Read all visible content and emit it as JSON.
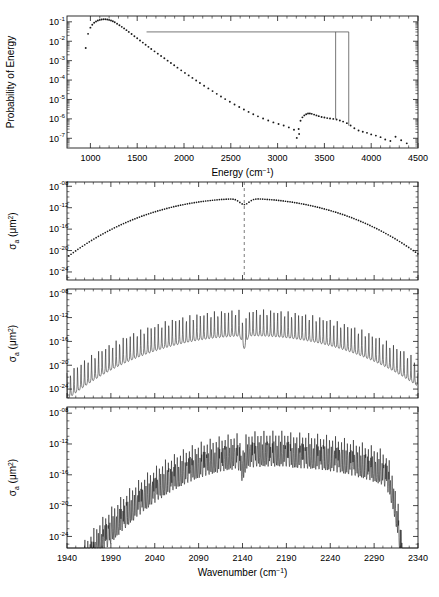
{
  "figure": {
    "background_color": "#ffffff",
    "ink_color": "#1a1a1a",
    "overlay_color": "#555555"
  },
  "chart_data": [
    {
      "id": "panel-1",
      "type": "scatter",
      "title": "",
      "xlabel": "Energy (cm⁻¹)",
      "ylabel": "Probability of Energy",
      "xlim": [
        750,
        4500
      ],
      "ylim_exp": [
        -7.5,
        -0.7
      ],
      "yscale": "log",
      "xticks": [
        1000,
        1500,
        2000,
        2500,
        3000,
        3500,
        4000,
        4500
      ],
      "xtick_labels": [
        "1000",
        "1500",
        "2000",
        "2500",
        "3000",
        "3500",
        "4000",
        "4500"
      ],
      "ytick_exponents": [
        -1,
        -2,
        -3,
        -4,
        -5,
        -6,
        -7
      ],
      "ytick_labels": [
        "10⁻¹",
        "10⁻²",
        "10⁻³",
        "10⁻⁴",
        "10⁻⁵",
        "10⁻⁶",
        "10⁻⁷"
      ],
      "grid": false,
      "legend": "none",
      "marker": "dot",
      "series": [
        {
          "name": "probability-of-energy",
          "x": [
            950,
            975,
            1000,
            1020,
            1040,
            1060,
            1080,
            1100,
            1120,
            1140,
            1160,
            1180,
            1200,
            1220,
            1240,
            1260,
            1285,
            1310,
            1335,
            1360,
            1385,
            1410,
            1440,
            1470,
            1500,
            1530,
            1560,
            1590,
            1620,
            1650,
            1685,
            1720,
            1755,
            1790,
            1825,
            1860,
            1895,
            1930,
            1970,
            2010,
            2050,
            2090,
            2130,
            2170,
            2215,
            2260,
            2305,
            2350,
            2395,
            2440,
            2490,
            2540,
            2590,
            2640,
            2690,
            2740,
            2790,
            2845,
            2900,
            2955,
            3010,
            3065,
            3120,
            3175,
            3230
          ],
          "y_exp": [
            -2.35,
            -1.62,
            -1.3,
            -1.15,
            -1.05,
            -0.98,
            -0.93,
            -0.9,
            -0.88,
            -0.87,
            -0.87,
            -0.88,
            -0.9,
            -0.93,
            -0.97,
            -1.02,
            -1.1,
            -1.18,
            -1.26,
            -1.34,
            -1.43,
            -1.52,
            -1.63,
            -1.74,
            -1.85,
            -1.96,
            -2.07,
            -2.18,
            -2.29,
            -2.4,
            -2.52,
            -2.64,
            -2.76,
            -2.88,
            -3.0,
            -3.12,
            -3.24,
            -3.36,
            -3.5,
            -3.63,
            -3.76,
            -3.89,
            -4.02,
            -4.15,
            -4.29,
            -4.43,
            -4.57,
            -4.71,
            -4.85,
            -4.98,
            -5.12,
            -5.26,
            -5.39,
            -5.52,
            -5.64,
            -5.76,
            -5.87,
            -5.98,
            -6.08,
            -6.18,
            -6.26,
            -6.34,
            -6.44,
            -6.56,
            -6.78
          ]
        },
        {
          "name": "secondary-band",
          "x": [
            3205,
            3225,
            3245,
            3265,
            3285,
            3305,
            3325,
            3345,
            3365,
            3390,
            3415,
            3440,
            3470,
            3500,
            3530,
            3560,
            3595,
            3630,
            3665,
            3700,
            3740,
            3780,
            3820,
            3865,
            3910,
            3955,
            4000,
            4050,
            4100,
            4150,
            4205,
            4260,
            4320,
            4380
          ],
          "y_exp": [
            -6.98,
            -6.52,
            -6.1,
            -5.92,
            -5.82,
            -5.76,
            -5.72,
            -5.72,
            -5.74,
            -5.78,
            -5.82,
            -5.86,
            -5.9,
            -5.93,
            -5.96,
            -5.98,
            -6.0,
            -6.03,
            -6.08,
            -6.14,
            -6.22,
            -6.34,
            -6.48,
            -6.6,
            -6.66,
            -6.72,
            -6.8,
            -6.86,
            -6.94,
            -7.06,
            -7.14,
            -6.92,
            -7.1,
            -7.26
          ]
        }
      ],
      "annotations": [
        {
          "name": "band-selection-overlay",
          "type": "bracket",
          "x_start": 1600,
          "x_end": 3760,
          "y_exp": -1.52,
          "drop_x": [
            3620,
            3760
          ],
          "drop_y_exp": [
            -6.0,
            -6.35
          ]
        }
      ]
    },
    {
      "id": "panel-2",
      "type": "scatter",
      "title": "",
      "xlabel": "",
      "ylabel": "σa (μm²)",
      "ylabel_parts": {
        "sigma": "σ",
        "sub": "a",
        "units": "(μm²)"
      },
      "xlim": [
        1940,
        2340
      ],
      "ylim_exp": [
        -25.5,
        -7.2
      ],
      "yscale": "log",
      "xticks": [
        1940,
        1990,
        2040,
        2090,
        2140,
        2190,
        2240,
        2290,
        2340
      ],
      "ytick_exponents": [
        -8,
        -12,
        -16,
        -20,
        -24
      ],
      "ytick_labels": [
        "10⁻⁰⁸",
        "10⁻¹²",
        "10⁻¹⁶",
        "10⁻²⁰",
        "10⁻²⁴"
      ],
      "grid": false,
      "legend": "none",
      "marker": "dot",
      "description": "Smoothed band absorption cross-section, dotted envelope",
      "series": [
        {
          "name": "sigma-a-smoothed",
          "envelope_peak_exp": -10.3,
          "left_edge_exp": -19.8,
          "right_edge_exp": -19.4,
          "peak_left_x": 2105,
          "peak_right_x": 2180,
          "dip_x": 2142,
          "dip_depth_exp": -11.2
        }
      ],
      "annotations": [
        {
          "name": "band-center-marker",
          "type": "vline",
          "x": 2142,
          "style": "dashed"
        }
      ]
    },
    {
      "id": "panel-3",
      "type": "line",
      "title": "",
      "xlabel": "",
      "ylabel": "σa (μm²)",
      "ylabel_parts": {
        "sigma": "σ",
        "sub": "a",
        "units": "(μm²)"
      },
      "xlim": [
        1940,
        2340
      ],
      "ylim_exp": [
        -25.5,
        -7.2
      ],
      "yscale": "log",
      "xticks": [
        1940,
        1990,
        2040,
        2090,
        2140,
        2190,
        2240,
        2290,
        2340
      ],
      "ytick_exponents": [
        -8,
        -12,
        -16,
        -20,
        -24
      ],
      "ytick_labels": [
        "10⁻⁰⁸",
        "10⁻¹²",
        "10⁻¹⁶",
        "10⁻²⁰",
        "10⁻²⁴"
      ],
      "grid": false,
      "legend": "none",
      "description": "Rotationally resolved line-by-line cross-section, regular comb spacing",
      "series": [
        {
          "name": "sigma-a-line-by-line-coarse",
          "line_spacing_cm": 4.0,
          "peak_envelope_exp": -10.6,
          "baseline_envelope_offset_exp": -3.2,
          "peak_center_x": 2150,
          "envelope_width": 235,
          "gap_x": 2142
        }
      ]
    },
    {
      "id": "panel-4",
      "type": "line",
      "title": "",
      "xlabel": "Wavenumber (cm⁻¹)",
      "ylabel": "σa (μm²)",
      "ylabel_parts": {
        "sigma": "σ",
        "sub": "a",
        "units": "(μm²)"
      },
      "xlim": [
        1940,
        2340
      ],
      "ylim_exp": [
        -25.5,
        -7.2
      ],
      "yscale": "log",
      "xticks": [
        1940,
        1990,
        2040,
        2090,
        2140,
        2190,
        2240,
        2290,
        2340
      ],
      "xtick_labels": [
        "1940",
        "1990",
        "2040",
        "2090",
        "2140",
        "2190",
        "2240",
        "2290",
        "2340"
      ],
      "ytick_exponents": [
        -8,
        -12,
        -16,
        -20,
        -24
      ],
      "ytick_labels": [
        "10⁻⁰⁸",
        "10⁻¹²",
        "10⁻¹⁶",
        "10⁻²⁰",
        "10⁻²⁴"
      ],
      "grid": false,
      "legend": "none",
      "description": "Hot-band congested line-by-line cross-section with steep high-wavenumber cutoff",
      "series": [
        {
          "name": "sigma-a-line-by-line-dense",
          "line_spacing_cm": 3.4,
          "peak_envelope_exp": -10.5,
          "peak_center_x": 2195,
          "envelope_width": 200,
          "cutoff_x": 2300,
          "cutoff_slope": "steep",
          "gap_x": 2140
        }
      ]
    }
  ]
}
